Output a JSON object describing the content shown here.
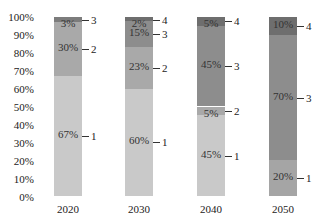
{
  "chart_data": {
    "type": "bar",
    "stacked": true,
    "percent": true,
    "title": "",
    "xlabel": "",
    "ylabel": "",
    "ylim": [
      0,
      100
    ],
    "yticks": [
      "0%",
      "10%",
      "20%",
      "30%",
      "40%",
      "50%",
      "60%",
      "70%",
      "80%",
      "90%",
      "100%"
    ],
    "grid": false,
    "legend": "none (segments labeled 1-4 by leader lines)",
    "categories": [
      "2020",
      "2030",
      "2040",
      "2050"
    ],
    "series": [
      {
        "name": "1",
        "values": [
          67,
          60,
          45,
          20
        ]
      },
      {
        "name": "2",
        "values": [
          30,
          23,
          5,
          0
        ]
      },
      {
        "name": "3",
        "values": [
          3,
          15,
          45,
          70
        ]
      },
      {
        "name": "4",
        "values": [
          0,
          2,
          5,
          10
        ]
      }
    ],
    "bars": [
      {
        "year": "2020",
        "segments": [
          {
            "series": "1",
            "value": 67,
            "label": "67%",
            "color": "#c9c9c9"
          },
          {
            "series": "2",
            "value": 30,
            "label": "30%",
            "color": "#a9a9a9"
          },
          {
            "series": "3",
            "value": 3,
            "label": "3%",
            "color": "#7c7c7c"
          }
        ]
      },
      {
        "year": "2030",
        "segments": [
          {
            "series": "1",
            "value": 60,
            "label": "60%",
            "color": "#c9c9c9"
          },
          {
            "series": "2",
            "value": 23,
            "label": "23%",
            "color": "#a9a9a9"
          },
          {
            "series": "3",
            "value": 15,
            "label": "15%",
            "color": "#8d8d8d"
          },
          {
            "series": "4",
            "value": 2,
            "label": "2%",
            "color": "#6e6e6e"
          }
        ]
      },
      {
        "year": "2040",
        "segments": [
          {
            "series": "1",
            "value": 45,
            "label": "45%",
            "color": "#c9c9c9"
          },
          {
            "series": "2",
            "value": 5,
            "label": "5%",
            "color": "#a9a9a9"
          },
          {
            "series": "3",
            "value": 45,
            "label": "45%",
            "color": "#8d8d8d"
          },
          {
            "series": "4",
            "value": 5,
            "label": "5%",
            "color": "#6e6e6e"
          }
        ]
      },
      {
        "year": "2050",
        "segments": [
          {
            "series": "1",
            "value": 20,
            "label": "20%",
            "color": "#a5a5a5"
          },
          {
            "series": "3",
            "value": 70,
            "label": "70%",
            "color": "#8d8d8d"
          },
          {
            "series": "4",
            "value": 10,
            "label": "10%",
            "color": "#6e6e6e"
          }
        ]
      }
    ]
  }
}
